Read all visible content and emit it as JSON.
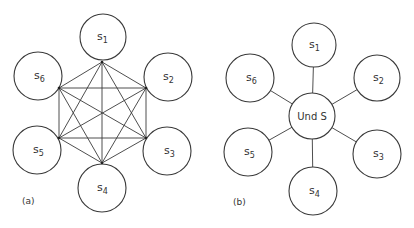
{
  "diagrams": [
    {
      "id": "a",
      "caption": "(a)",
      "type": "fully-connected mesh",
      "nodes": [
        {
          "id": "s1",
          "base": "s",
          "sub": "1"
        },
        {
          "id": "s2",
          "base": "s",
          "sub": "2"
        },
        {
          "id": "s3",
          "base": "s",
          "sub": "3"
        },
        {
          "id": "s4",
          "base": "s",
          "sub": "4"
        },
        {
          "id": "s5",
          "base": "s",
          "sub": "5"
        },
        {
          "id": "s6",
          "base": "s",
          "sub": "6"
        }
      ],
      "edges": "all pairs of s1..s6"
    },
    {
      "id": "b",
      "caption": "(b)",
      "type": "star",
      "hub": {
        "id": "und",
        "label": "Und S"
      },
      "nodes": [
        {
          "id": "s1",
          "base": "s",
          "sub": "1"
        },
        {
          "id": "s2",
          "base": "s",
          "sub": "2"
        },
        {
          "id": "s3",
          "base": "s",
          "sub": "3"
        },
        {
          "id": "s4",
          "base": "s",
          "sub": "4"
        },
        {
          "id": "s5",
          "base": "s",
          "sub": "5"
        },
        {
          "id": "s6",
          "base": "s",
          "sub": "6"
        }
      ],
      "edges": "each s_i connected to Und S"
    }
  ]
}
